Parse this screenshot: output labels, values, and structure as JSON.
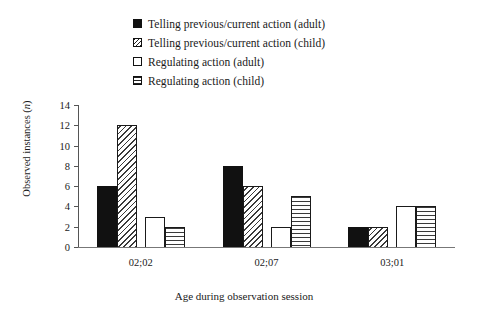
{
  "chart_data": {
    "type": "bar",
    "title": "",
    "xlabel": "Age during observation session",
    "ylabel": "Observed instances (n)",
    "ylim": [
      0,
      14
    ],
    "yticks": [
      0,
      2,
      4,
      6,
      8,
      10,
      12,
      14
    ],
    "grid": false,
    "legend_position": "top",
    "categories": [
      "02;02",
      "02;07",
      "03;01"
    ],
    "series": [
      {
        "name": "Telling previous/current action (adult)",
        "pattern": "solid-black",
        "values": [
          6,
          8,
          2
        ]
      },
      {
        "name": "Telling previous/current action (child)",
        "pattern": "diagonal-hatch",
        "values": [
          12,
          6,
          2
        ]
      },
      {
        "name": "Regulating action (adult)",
        "pattern": "empty-white",
        "values": [
          3,
          2,
          4
        ]
      },
      {
        "name": "Regulating action (child)",
        "pattern": "horizontal-lines",
        "values": [
          2,
          5,
          4
        ]
      }
    ]
  },
  "legend": {
    "items": [
      {
        "label": "Telling previous/current action (adult)",
        "swatch": "solid-black-swatch"
      },
      {
        "label": "Telling previous/current action (child)",
        "swatch": "diagonal-hatch-swatch"
      },
      {
        "label": "Regulating action (adult)",
        "swatch": "empty-white-swatch"
      },
      {
        "label": "Regulating action (child)",
        "swatch": "horizontal-lines-swatch"
      }
    ]
  },
  "axes": {
    "y_title_prefix": "Observed instances (",
    "y_title_italic": "n",
    "y_title_suffix": ")",
    "y_tick_labels": [
      "14",
      "12",
      "10",
      "8",
      "6",
      "4",
      "2",
      "0"
    ],
    "x_tick_labels": [
      "02;02",
      "02;07",
      "03;01"
    ],
    "x_title": "Age during observation session"
  },
  "colors": {
    "ink": "#1a1a1a",
    "axis": "#555555",
    "baseline": "#777777",
    "background": "#ffffff"
  }
}
